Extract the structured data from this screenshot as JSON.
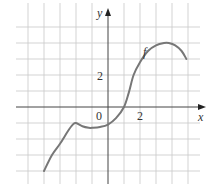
{
  "chart_data": {
    "type": "line",
    "title": "",
    "xlabel": "x",
    "ylabel": "y",
    "curve_label": "f",
    "tick_labels": {
      "origin": "0",
      "x": [
        "2"
      ],
      "y": [
        "2"
      ]
    },
    "xlim": [
      -5,
      5
    ],
    "ylim": [
      -4,
      5
    ],
    "grid": true,
    "grid_step": 1,
    "series": [
      {
        "name": "f",
        "x": [
          -4,
          -3.5,
          -3,
          -2.5,
          -2.2,
          -2,
          -1.6,
          -1.2,
          -1,
          -0.5,
          0,
          0.5,
          1,
          1.3,
          1.6,
          2,
          2.5,
          3,
          3.5,
          3.8,
          4.2,
          4.6,
          4.9
        ],
        "y": [
          -4,
          -3.0,
          -2.3,
          -1.5,
          -1.1,
          -1.0,
          -1.2,
          -1.3,
          -1.3,
          -1.25,
          -1.1,
          -0.7,
          0,
          0.9,
          2.0,
          2.8,
          3.5,
          3.85,
          4.0,
          4.0,
          3.85,
          3.5,
          3.0
        ]
      }
    ],
    "colors": {
      "curve": "#777777",
      "axes": "#444444",
      "grid": "#c8c8c8"
    }
  }
}
